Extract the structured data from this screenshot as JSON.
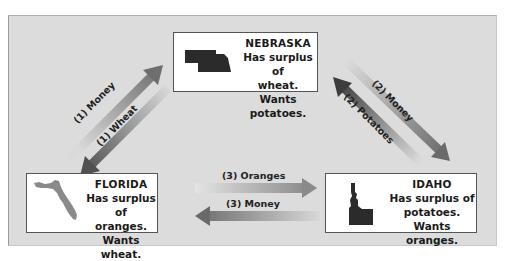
{
  "nodes": {
    "nebraska": {
      "name": "NEBRASKA",
      "line1": "Has surplus of",
      "line2": "wheat.",
      "line3": "Wants potatoes.",
      "map_color": "#2b2b2b"
    },
    "florida": {
      "name": "FLORIDA",
      "line1": "Has surplus of",
      "line2": "oranges.",
      "line3": "Wants wheat.",
      "map_color": "#8a8a8a"
    },
    "idaho": {
      "name": "IDAHO",
      "line1": "Has surplus of",
      "line2": "potatoes.",
      "line3": "Wants oranges.",
      "map_color": "#2b2b2b"
    }
  },
  "flows": [
    {
      "id": "1-money",
      "label": "(1) Money",
      "from": "FLORIDA",
      "to": "NEBRASKA"
    },
    {
      "id": "1-wheat",
      "label": "(1) Wheat",
      "from": "NEBRASKA",
      "to": "FLORIDA"
    },
    {
      "id": "2-money",
      "label": "(2) Money",
      "from": "NEBRASKA",
      "to": "IDAHO"
    },
    {
      "id": "2-potatoes",
      "label": "(2) Potatoes",
      "from": "IDAHO",
      "to": "NEBRASKA"
    },
    {
      "id": "3-oranges",
      "label": "(3) Oranges",
      "from": "FLORIDA",
      "to": "IDAHO"
    },
    {
      "id": "3-money",
      "label": "(3) Money",
      "from": "IDAHO",
      "to": "FLORIDA"
    }
  ],
  "colors": {
    "background": "#dcdcdc",
    "arrow_dark": "#555555",
    "arrow_light": "#d8d8d8",
    "box_border": "#555555"
  }
}
